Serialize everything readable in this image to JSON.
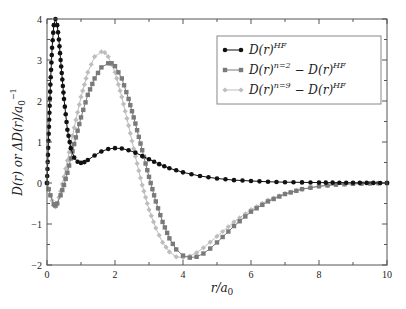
{
  "chart_data": {
    "type": "line",
    "title": "",
    "xlabel": "r/a_0",
    "ylabel": "D(r) or ΔD(r)/a_0^-1",
    "xlim": [
      0,
      10
    ],
    "ylim": [
      -2,
      4
    ],
    "xticks": [
      0,
      2,
      4,
      6,
      8,
      10
    ],
    "yticks": [
      -2,
      -1,
      0,
      1,
      2,
      3,
      4
    ],
    "grid": false,
    "legend_position": "upper right",
    "series": [
      {
        "name": "D(r)^HF",
        "color": "#111111",
        "marker": "circle",
        "x": [
          0,
          0.05,
          0.1,
          0.15,
          0.2,
          0.25,
          0.3,
          0.35,
          0.4,
          0.5,
          0.6,
          0.7,
          0.8,
          0.9,
          1.0,
          1.1,
          1.2,
          1.4,
          1.6,
          1.8,
          2.0,
          2.2,
          2.4,
          2.6,
          2.8,
          3.0,
          3.3,
          3.6,
          4.0,
          4.5,
          5.0,
          5.5,
          6.0,
          6.5,
          7.0,
          7.5,
          8.0,
          9.0,
          10.0
        ],
        "values": [
          0,
          1.2,
          2.4,
          3.3,
          3.85,
          4.0,
          3.85,
          3.5,
          3.0,
          2.05,
          1.3,
          0.85,
          0.62,
          0.52,
          0.49,
          0.51,
          0.56,
          0.67,
          0.77,
          0.83,
          0.85,
          0.84,
          0.8,
          0.74,
          0.66,
          0.58,
          0.46,
          0.36,
          0.26,
          0.17,
          0.11,
          0.07,
          0.05,
          0.03,
          0.02,
          0.015,
          0.01,
          0.005,
          0.0
        ]
      },
      {
        "name": "D(r)^{n=2} - D(r)^HF",
        "color": "#7a7a7a",
        "marker": "square",
        "x": [
          0,
          0.1,
          0.2,
          0.25,
          0.3,
          0.4,
          0.5,
          0.6,
          0.7,
          0.8,
          1.0,
          1.2,
          1.4,
          1.6,
          1.8,
          1.9,
          2.0,
          2.2,
          2.4,
          2.6,
          2.8,
          3.0,
          3.2,
          3.4,
          3.6,
          3.8,
          4.0,
          4.2,
          4.4,
          4.6,
          4.8,
          5.0,
          5.5,
          6.0,
          6.5,
          7.0,
          7.5,
          8.0,
          8.5,
          9.0,
          9.5,
          10.0
        ],
        "values": [
          0,
          -0.3,
          -0.52,
          -0.55,
          -0.5,
          -0.3,
          -0.05,
          0.25,
          0.6,
          0.95,
          1.6,
          2.15,
          2.55,
          2.82,
          2.92,
          2.92,
          2.85,
          2.55,
          2.05,
          1.45,
          0.8,
          0.15,
          -0.45,
          -0.95,
          -1.35,
          -1.62,
          -1.77,
          -1.82,
          -1.8,
          -1.72,
          -1.6,
          -1.45,
          -1.05,
          -0.7,
          -0.45,
          -0.27,
          -0.15,
          -0.08,
          -0.04,
          -0.02,
          -0.01,
          0.0
        ]
      },
      {
        "name": "D(r)^{n=9} - D(r)^HF",
        "color": "#bdbdbd",
        "marker": "diamond",
        "x": [
          0,
          0.1,
          0.2,
          0.25,
          0.3,
          0.4,
          0.5,
          0.6,
          0.7,
          0.8,
          1.0,
          1.2,
          1.4,
          1.6,
          1.7,
          1.8,
          2.0,
          2.2,
          2.4,
          2.6,
          2.8,
          3.0,
          3.2,
          3.4,
          3.6,
          3.8,
          4.0,
          4.2,
          4.4,
          4.6,
          4.8,
          5.0,
          5.5,
          6.0,
          6.5,
          7.0,
          7.5,
          8.0,
          8.5,
          9.0,
          9.5,
          10.0
        ],
        "values": [
          0,
          -0.3,
          -0.55,
          -0.58,
          -0.5,
          -0.2,
          0.15,
          0.55,
          0.95,
          1.35,
          2.1,
          2.7,
          3.08,
          3.2,
          3.18,
          3.08,
          2.7,
          2.1,
          1.4,
          0.65,
          -0.05,
          -0.65,
          -1.1,
          -1.45,
          -1.68,
          -1.8,
          -1.82,
          -1.78,
          -1.7,
          -1.58,
          -1.44,
          -1.3,
          -0.95,
          -0.65,
          -0.42,
          -0.26,
          -0.15,
          -0.08,
          -0.04,
          -0.02,
          -0.01,
          0.0
        ]
      }
    ]
  },
  "legend": {
    "items": [
      {
        "base": "D(r)",
        "sup": "HF",
        "tail_base": "",
        "tail_sup": ""
      },
      {
        "base": "D(r)",
        "sup": "n=2",
        "tail_base": " − D(r)",
        "tail_sup": "HF"
      },
      {
        "base": "D(r)",
        "sup": "n=9",
        "tail_base": " − D(r)",
        "tail_sup": "HF"
      }
    ]
  },
  "axes": {
    "xlabel_main": "r/a",
    "xlabel_sub": "0",
    "ylabel_main": "D(r) or ΔD(r)/a",
    "ylabel_sub": "0",
    "ylabel_sup": "−1"
  }
}
